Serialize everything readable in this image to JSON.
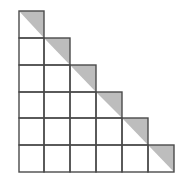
{
  "diagram": {
    "type": "staircase-grid",
    "rows": 6,
    "origin": {
      "x": 19,
      "y": 11
    },
    "col_lines": [
      19,
      44,
      70,
      96,
      122,
      148,
      174
    ],
    "row_lines": [
      11,
      38,
      65,
      92,
      118,
      145,
      172
    ],
    "shaded_half": "upper-right",
    "colors": {
      "line": "#4a4a4a",
      "shade": "#bdbdbd",
      "background": "#ffffff"
    }
  }
}
